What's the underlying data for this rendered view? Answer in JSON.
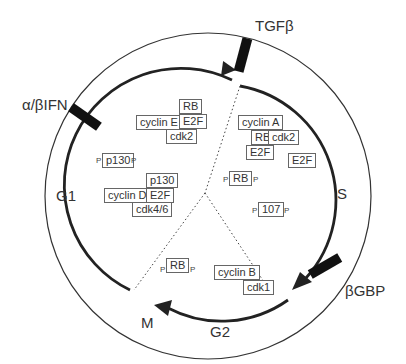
{
  "phases": {
    "g1": "G1",
    "s": "S",
    "g2": "G2",
    "m": "M"
  },
  "inhibitors": {
    "tgfb": "TGFβ",
    "ifn": "α/βIFN",
    "bgbp": "βGBP"
  },
  "complexes": {
    "cyclinE": {
      "rb": "RB",
      "cyclin": "cyclin E",
      "e2f": "E2F",
      "cdk": "cdk2"
    },
    "cyclinA": {
      "cyclin": "cyclin A",
      "rb": "RB",
      "cdk": "cdk2",
      "e2f": "E2F"
    },
    "free_e2f": "E2F",
    "p130_phos": {
      "label": "p130",
      "p": "P"
    },
    "cyclinD": {
      "p130": "p130",
      "cyclin": "cyclin D",
      "e2f": "E2F",
      "cdk": "cdk4/6"
    },
    "rb_phos_center": {
      "label": "RB",
      "p": "P"
    },
    "p107_phos": {
      "label": "107",
      "p": "P"
    },
    "rb_phos_m": {
      "label": "RB",
      "p": "P"
    },
    "cyclinB": {
      "cyclin": "cyclin B",
      "cdk": "cdk1"
    }
  }
}
